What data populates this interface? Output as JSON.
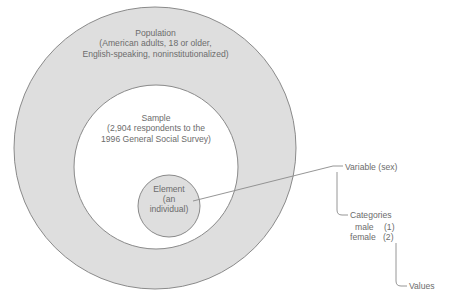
{
  "figure": {
    "circles": {
      "population": {
        "label_line1": "Population",
        "label_line2": "(American adults, 18 or older,",
        "label_line3": "English-speaking, noninstitutionalized)",
        "fill": "#dedede",
        "stroke": "#8a8a8a"
      },
      "sample": {
        "label_line1": "Sample",
        "label_line2": "(2,904 respondents to the",
        "label_line3": "1996 General Social Survey)",
        "fill": "#ffffff",
        "stroke": "#8a8a8a"
      },
      "element": {
        "label_line1": "Element",
        "label_line2": "(an",
        "label_line3": "individual)",
        "fill": "#dedede",
        "stroke": "#8a8a8a"
      }
    },
    "annotations": {
      "variable": "Variable (sex)",
      "categories": "Categories",
      "values": "Values",
      "category_rows": [
        {
          "name": "male",
          "code": "(1)"
        },
        {
          "name": "female",
          "code": "(2)"
        }
      ]
    },
    "colors": {
      "text": "#6c6c6c",
      "line": "#8a8a8a",
      "background": "#ffffff"
    }
  }
}
